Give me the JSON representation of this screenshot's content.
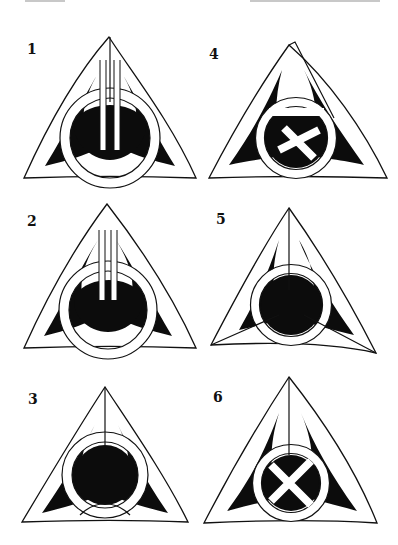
{
  "colors": {
    "ink": "#111111",
    "fill": "#0c0c0c",
    "paper": "#ffffff"
  },
  "panels": [
    {
      "label": "1",
      "variant": "split-apex triquetra with interlaced circle"
    },
    {
      "label": "4",
      "variant": "triquetra with knotted inner loop"
    },
    {
      "label": "2",
      "variant": "split-apex triquetra with crossing circle"
    },
    {
      "label": "5",
      "variant": "triquetra with split tips on all three points"
    },
    {
      "label": "3",
      "variant": "triquetra with braided inner ring"
    },
    {
      "label": "6",
      "variant": "split-apex triquetra with knotted center loop"
    }
  ]
}
